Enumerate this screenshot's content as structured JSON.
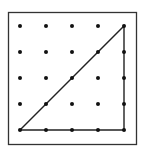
{
  "diagram": {
    "type": "geoboard",
    "grid": {
      "rows": 5,
      "cols": 5,
      "origin_x": 20,
      "origin_y": 26,
      "spacing": 26
    },
    "frame": {
      "x": 8.5,
      "y": 12.5,
      "width": 128,
      "height": 132,
      "color": "#333333"
    },
    "dot_color": "#111111",
    "line_color": "#222222",
    "triangle": {
      "vertices": [
        [
          0,
          4
        ],
        [
          4,
          0
        ],
        [
          4,
          4
        ]
      ],
      "description": "Right triangle from bottom-left to top-right to bottom-right"
    }
  }
}
